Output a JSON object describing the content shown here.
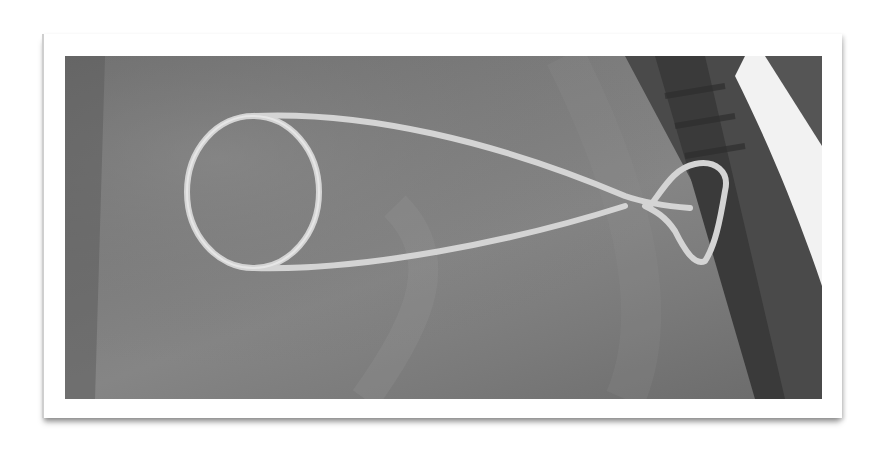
{
  "image": {
    "description": "Grayscale photograph of a bent wire loop tool lying on gray fabric, shown in a white photo frame with drop shadow",
    "subject": "wire-loop-tool",
    "background": "gray-fabric",
    "colors": {
      "frame": "#ffffff",
      "fabric": "#7b7b7b",
      "wire": "#d6d6d6",
      "dark_strap": "#3a3a3a"
    }
  }
}
